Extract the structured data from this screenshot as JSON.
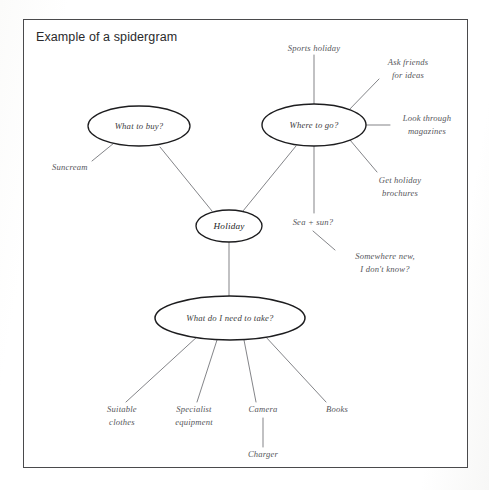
{
  "page": {
    "title": "Example of a spidergram",
    "background_color": "#ffffff",
    "frame_color": "#4a4a4c",
    "ink_color": "#55565a"
  },
  "diagram": {
    "type": "spidergram",
    "center": {
      "label": "Holiday"
    },
    "nodes": [
      {
        "id": "what-to-buy",
        "label": "What to buy?"
      },
      {
        "id": "where-to-go",
        "label": "Where to go?"
      },
      {
        "id": "what-to-take",
        "label": "What do I need to take?"
      }
    ],
    "branches": {
      "what_to_buy": [
        {
          "label": "Suncream"
        }
      ],
      "where_to_go": [
        {
          "label": "Sports holiday"
        },
        {
          "label": "Ask friends\nfor ideas"
        },
        {
          "label": "Look through\nmagazines"
        },
        {
          "label": "Get holiday\nbrochures"
        },
        {
          "label": "Sea + sun?"
        },
        {
          "label": "Somewhere new,\nI don't know?"
        }
      ],
      "what_to_take": [
        {
          "label": "Suitable\nclothes"
        },
        {
          "label": "Specialist\nequipment"
        },
        {
          "label": "Camera"
        },
        {
          "label": "Charger"
        },
        {
          "label": "Books"
        }
      ]
    }
  }
}
